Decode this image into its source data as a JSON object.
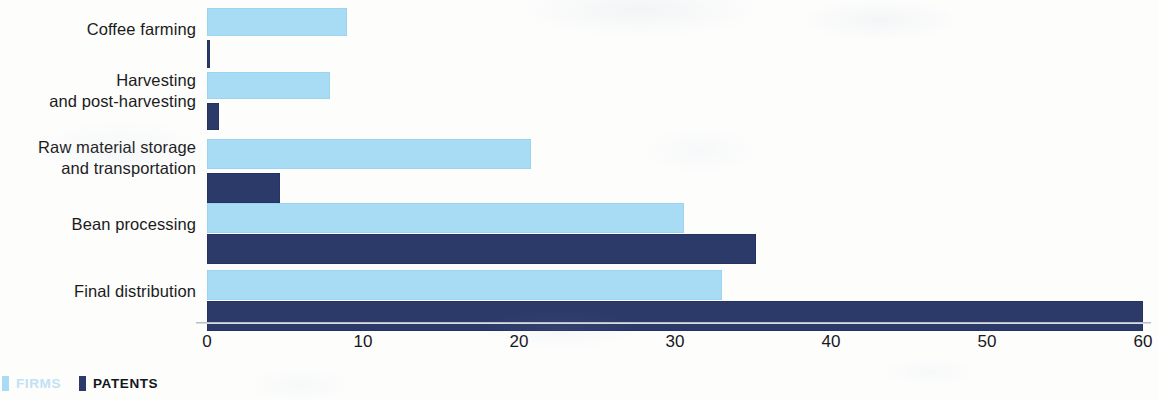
{
  "chart_data": {
    "type": "bar",
    "orientation": "horizontal",
    "title": "",
    "subtitle": "",
    "xlabel": "",
    "ylabel": "",
    "xlim": [
      0,
      60
    ],
    "xticks": [
      0,
      10,
      20,
      30,
      40,
      50,
      60
    ],
    "grid": false,
    "legend_position": "bottom-left",
    "categories": [
      "Coffee farming",
      "Harvesting\nand post-harvesting",
      "Raw material storage\nand transportation",
      "Bean processing",
      "Final distribution"
    ],
    "series": [
      {
        "name": "FIRMS",
        "color": "#a8dcf5",
        "values": [
          9,
          7.9,
          20.8,
          30.6,
          33
        ]
      },
      {
        "name": "PATENTS",
        "color": "#2b3a68",
        "values": [
          0.2,
          0.8,
          4.7,
          35.2,
          60
        ]
      }
    ]
  },
  "categories": [
    {
      "line1": "Coffee farming",
      "line2": ""
    },
    {
      "line1": "Harvesting",
      "line2": "and post-harvesting"
    },
    {
      "line1": "Raw material storage",
      "line2": "and transportation"
    },
    {
      "line1": "Bean processing",
      "line2": ""
    },
    {
      "line1": "Final distribution",
      "line2": ""
    }
  ],
  "ticks": [
    {
      "label": "0"
    },
    {
      "label": "10"
    },
    {
      "label": "20"
    },
    {
      "label": "30"
    },
    {
      "label": "40"
    },
    {
      "label": "50"
    },
    {
      "label": "60"
    }
  ],
  "legend": {
    "firms_label": "FIRMS",
    "patents_label": "PATENTS",
    "firms_color": "#a8dcf5",
    "patents_color": "#2b3a68"
  }
}
